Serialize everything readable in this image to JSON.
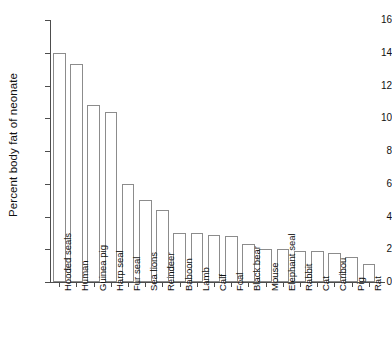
{
  "chart_data": {
    "type": "bar",
    "title": "",
    "xlabel": "",
    "ylabel": "Percent body fat of neonate",
    "ylim": [
      0,
      16
    ],
    "yticks": [
      0,
      2,
      4,
      6,
      8,
      10,
      12,
      14,
      16
    ],
    "ytick_labels": [
      "0",
      "2",
      "4",
      "6",
      "8",
      "10",
      "12",
      "14",
      "16"
    ],
    "grid": false,
    "legend": null,
    "categories": [
      "Hooded seals",
      "Human",
      "Guinea pig",
      "Harp seal",
      "Fur seal",
      "Sea lions",
      "Reindeer",
      "Baboon",
      "Lamb",
      "Calf",
      "Foal",
      "Black bear",
      "Mouse",
      "Elephant seal",
      "Rabbit",
      "Cat",
      "Caribou",
      "Pig",
      "Rat"
    ],
    "values": [
      14.0,
      13.3,
      10.8,
      10.4,
      6.0,
      5.0,
      4.4,
      3.0,
      3.0,
      2.9,
      2.8,
      2.3,
      2.0,
      2.0,
      1.9,
      1.9,
      1.8,
      1.5,
      1.1
    ],
    "bar_color": "#ffffff",
    "bar_edge_color": "#8c8c8c",
    "axis_color": "#4d4d4d"
  }
}
